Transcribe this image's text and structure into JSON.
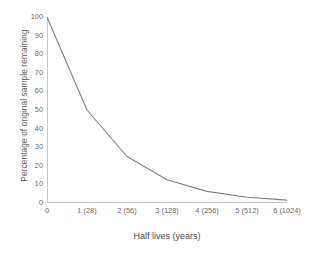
{
  "chart_data": {
    "type": "line",
    "title": "",
    "xlabel": "Half lives (years)",
    "ylabel": "Percentage of original sample remaining",
    "x": [
      0,
      1,
      2,
      3,
      4,
      5,
      6
    ],
    "values": [
      100,
      50,
      25,
      12.5,
      6.25,
      3.125,
      1.5625
    ],
    "categories": [
      "0",
      "1 (28)",
      "2 (56)",
      "3 (128)",
      "4 (256)",
      "5 (512)",
      "6 (1024)"
    ],
    "xtick_labels": [
      "0",
      "1 (28)",
      "2 (56)",
      "3 (128)",
      "4 (256)",
      "5 (512)",
      "6 (1024)"
    ],
    "ytick_labels": [
      "0",
      "10",
      "20",
      "30",
      "40",
      "50",
      "60",
      "70",
      "80",
      "90",
      "100"
    ],
    "ytick_values": [
      0,
      10,
      20,
      30,
      40,
      50,
      60,
      70,
      80,
      90,
      100
    ],
    "xlim": [
      0,
      6
    ],
    "ylim": [
      0,
      100
    ],
    "grid": false,
    "legend": false,
    "legend_position": "none",
    "series": [
      {
        "name": "Percentage of original sample remaining",
        "values": [
          100,
          50,
          25,
          12.5,
          6.25,
          3.125,
          1.5625
        ],
        "color": "#808080"
      }
    ],
    "line_color": "#808080",
    "axis_color": "#c9c9c9",
    "tick_label_color": "#6b6b6b",
    "axis_title_color": "#4d4d4d",
    "background_color": "#ffffff"
  }
}
